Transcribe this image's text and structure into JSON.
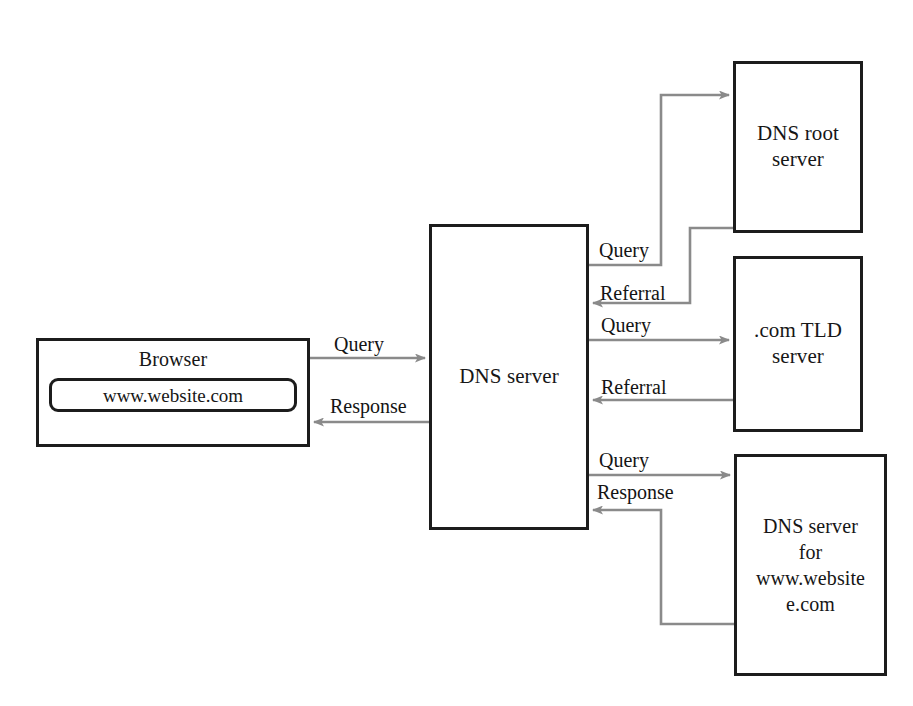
{
  "diagram": {
    "background_color": "#ffffff",
    "box_border_color": "#1c1c1c",
    "wire_color": "#8a8a8a",
    "text_color": "#161616",
    "nodes": {
      "browser": {
        "label": "Browser",
        "url_value": "www.website.com"
      },
      "dns_server": {
        "label": "DNS server"
      },
      "root_server": {
        "label": "DNS root\nserver"
      },
      "tld_server": {
        "label": ".com TLD\nserver"
      },
      "auth_server": {
        "label": "DNS server\nfor\nwww.website\ne.com"
      }
    },
    "edges": {
      "browser_query": "Query",
      "browser_response": "Response",
      "root_query": "Query",
      "root_referral": "Referral",
      "tld_query": "Query",
      "tld_referral": "Referral",
      "auth_query": "Query",
      "auth_response": "Response"
    }
  }
}
